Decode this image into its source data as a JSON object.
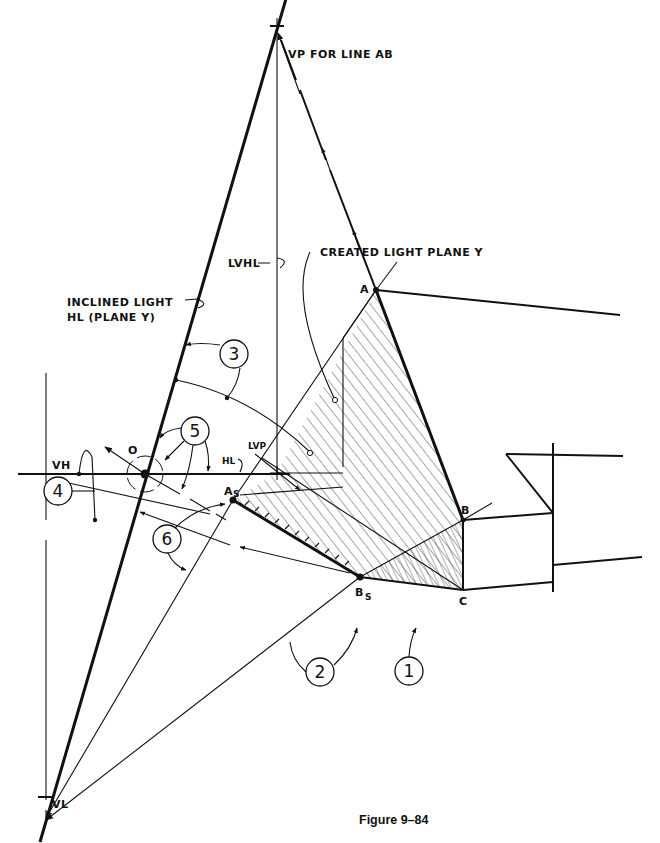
{
  "figure": {
    "caption": "Figure 9–84"
  },
  "labels": {
    "vp_line_ab": "VP FOR LINE AB",
    "lvhl": "LVHL",
    "created_light_plane": "CREATED LIGHT PLANE Y",
    "inclined_light_1": "INCLINED LIGHT",
    "inclined_light_2": "HL (PLANE Y)",
    "o": "O",
    "vh": "VH",
    "hl": "HL",
    "lvp": "LVP",
    "vl": "VL",
    "point_a": "A",
    "point_b": "B",
    "point_c": "C",
    "point_as": "A",
    "point_as_sub": "S",
    "point_bs": "B",
    "point_bs_sub": "S"
  },
  "callouts": [
    {
      "id": "1",
      "label": "1"
    },
    {
      "id": "2",
      "label": "2"
    },
    {
      "id": "3",
      "label": "3"
    },
    {
      "id": "4",
      "label": "4"
    },
    {
      "id": "5",
      "label": "5"
    },
    {
      "id": "6",
      "label": "6"
    }
  ],
  "colors": {
    "ink": "#111111",
    "paper": "#ffffff"
  }
}
